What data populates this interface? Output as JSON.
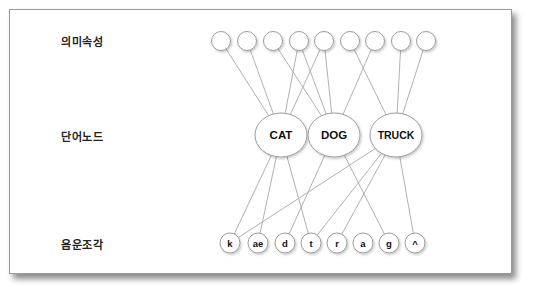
{
  "diagram": {
    "row_labels": {
      "semantic": "의미속성",
      "word": "단어노드",
      "phoneme": "음운조각"
    },
    "semantic_features": [
      {
        "id": "f1",
        "cx": 221
      },
      {
        "id": "f2",
        "cx": 247
      },
      {
        "id": "f3",
        "cx": 273
      },
      {
        "id": "f4",
        "cx": 299
      },
      {
        "id": "f5",
        "cx": 324
      },
      {
        "id": "f6",
        "cx": 350
      },
      {
        "id": "f7",
        "cx": 375
      },
      {
        "id": "f8",
        "cx": 401
      },
      {
        "id": "f9",
        "cx": 426
      }
    ],
    "word_nodes": [
      {
        "id": "CAT",
        "label": "CAT",
        "cx": 281
      },
      {
        "id": "DOG",
        "label": "DOG",
        "cx": 334
      },
      {
        "id": "TRUCK",
        "label": "TRUCK",
        "cx": 396
      }
    ],
    "phonemes": [
      {
        "id": "k",
        "label": "k",
        "cx": 230
      },
      {
        "id": "ae",
        "label": "ae",
        "cx": 258
      },
      {
        "id": "d",
        "label": "d",
        "cx": 285
      },
      {
        "id": "t",
        "label": "t",
        "cx": 311
      },
      {
        "id": "r",
        "label": "r",
        "cx": 337
      },
      {
        "id": "a",
        "label": "a",
        "cx": 363
      },
      {
        "id": "g",
        "label": "g",
        "cx": 389
      },
      {
        "id": "caret",
        "label": "^",
        "cx": 415
      }
    ],
    "feature_to_word_links": [
      [
        "f1",
        "CAT"
      ],
      [
        "f2",
        "CAT"
      ],
      [
        "f3",
        "DOG"
      ],
      [
        "f4",
        "CAT"
      ],
      [
        "f4",
        "DOG"
      ],
      [
        "f5",
        "CAT"
      ],
      [
        "f5",
        "DOG"
      ],
      [
        "f6",
        "TRUCK"
      ],
      [
        "f7",
        "DOG"
      ],
      [
        "f8",
        "TRUCK"
      ],
      [
        "f9",
        "TRUCK"
      ]
    ],
    "word_to_phoneme_links": [
      [
        "CAT",
        "k"
      ],
      [
        "CAT",
        "ae"
      ],
      [
        "CAT",
        "t"
      ],
      [
        "DOG",
        "d"
      ],
      [
        "DOG",
        "g"
      ],
      [
        "TRUCK",
        "k"
      ],
      [
        "TRUCK",
        "t"
      ],
      [
        "TRUCK",
        "r"
      ],
      [
        "TRUCK",
        "caret"
      ]
    ],
    "colors": {
      "line": "#a8a8a8",
      "node_stroke": "#9c9c9c",
      "node_fill": "#ffffff",
      "text": "#111111"
    }
  }
}
